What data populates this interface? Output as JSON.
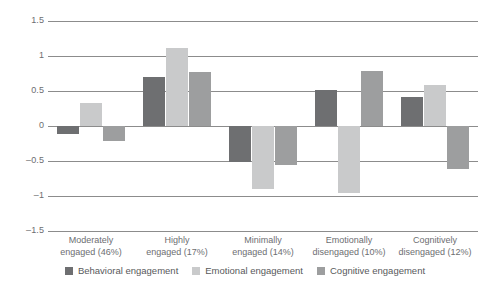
{
  "chart_data": {
    "type": "bar",
    "title": "",
    "xlabel": "",
    "ylabel": "",
    "ylim": [
      -1.5,
      1.5
    ],
    "yticks": [
      "1.5",
      "1",
      "0.5",
      "0",
      "–0.5",
      "–1",
      "–1.5"
    ],
    "ytick_values": [
      1.5,
      1,
      0.5,
      0,
      -0.5,
      -1,
      -1.5
    ],
    "grid": true,
    "legend_position": "bottom",
    "categories": [
      "Moderately engaged (46%)",
      "Highly engaged (17%)",
      "Minimally engaged (14%)",
      "Emotionally disengaged (10%)",
      "Cognitively disengaged (12%)"
    ],
    "category_lines": [
      [
        "Moderately",
        "engaged (46%)"
      ],
      [
        "Highly",
        "engaged (17%)"
      ],
      [
        "Minimally",
        "engaged (14%)"
      ],
      [
        "Emotionally",
        "disengaged (10%)"
      ],
      [
        "Cognitively",
        "disengaged (12%)"
      ]
    ],
    "series": [
      {
        "name": "Behavioral engagement",
        "color": "#6e6f71",
        "values": [
          -0.11,
          0.7,
          -0.52,
          0.52,
          0.42
        ]
      },
      {
        "name": "Emotional engagement",
        "color": "#c9cacb",
        "values": [
          0.33,
          1.12,
          -0.9,
          -0.95,
          0.58
        ]
      },
      {
        "name": "Cognitive engagement",
        "color": "#9d9e9f",
        "values": [
          -0.22,
          0.77,
          -0.55,
          0.79,
          -0.62
        ]
      }
    ]
  },
  "colors": {
    "grid": "#8c8c8c",
    "text": "#6d6e71",
    "legend_text": "#58595b",
    "background": "#ffffff"
  }
}
